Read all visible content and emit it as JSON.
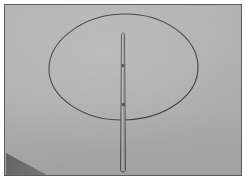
{
  "image": {
    "width": 246,
    "height": 180,
    "kind": "photograph",
    "description": "Overhead photo of a flat gray surface with a hand-drawn dark oval outline and a long thin rod lying vertically across it"
  },
  "frame": {
    "matte_label": "white photo matte",
    "border_label": "dark photo border",
    "matte_color": "#ffffff",
    "border_color": "#5c5c5c",
    "matte_width_px": 4,
    "border_width_px": 1
  },
  "surface": {
    "label": "gray background surface",
    "base_color": "#b0b0b0",
    "shade_color": "#a6a6a6",
    "highlight_color": "#b8b8b8"
  },
  "shadow": {
    "label": "corner shadow",
    "color": "#6e6e6e",
    "corner": "bottom-left",
    "points": "1,148 1,171 44,171"
  },
  "oval": {
    "label": "drawn oval outline",
    "stroke_color": "#3a3a3a",
    "stroke_width": 1.1,
    "center_x": 118,
    "center_y": 63,
    "radius_x": 74,
    "radius_y": 52,
    "path": "M 44,64 C 44,36 77,10 118,9 C 160,8 192,33 193,61 C 194,90 161,114 119,115 C 78,116 44,92 44,64 Z"
  },
  "rod": {
    "label": "thin vertical rod",
    "stroke_color": "#4a4a4a",
    "stroke_width": 1.0,
    "fill_color": "#adadad",
    "top_y": 27,
    "bottom_y": 169,
    "left_x": 114,
    "right_x": 121,
    "path": "M 116.5,30 C 116.5,27.5 119.5,27.5 119.6,30 L 120.4,164 C 120.4,168 115.6,168 115.6,164 Z"
  },
  "rod_marks": [
    {
      "label": "upper band mark",
      "x": 116.5,
      "y": 59,
      "width": 3.0,
      "height": 3.2,
      "color": "#474747"
    },
    {
      "label": "lower band mark",
      "x": 117.0,
      "y": 98,
      "width": 3.0,
      "height": 3.2,
      "color": "#4d4d4d"
    }
  ],
  "scuffs": [
    {
      "label": "faint scuff upper left",
      "path": "M 60,34 C 70,31 80,30 90,31",
      "opacity": 0.1
    },
    {
      "label": "faint scuff lower right",
      "path": "M 150,126 C 163,130 176,133 190,134",
      "opacity": 0.08
    },
    {
      "label": "faint scuff bottom",
      "path": "M 70,150 C 86,147 104,146 120,147",
      "opacity": 0.07
    }
  ]
}
